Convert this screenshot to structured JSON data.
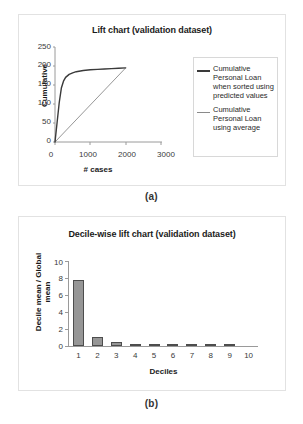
{
  "figure": {
    "caption_a": "(a)",
    "caption_b": "(b)"
  },
  "chart_data": [
    {
      "id": "lift-chart",
      "type": "line",
      "title": "Lift chart (validation dataset)",
      "xlabel": "# cases",
      "ylabel": "Cumulative",
      "xlim": [
        0,
        3000
      ],
      "ylim": [
        0,
        250
      ],
      "xticks": [
        0,
        1000,
        2000,
        3000
      ],
      "yticks": [
        0,
        50,
        100,
        150,
        200,
        250
      ],
      "grid": false,
      "legend_position": "right",
      "series": [
        {
          "name": "Cumulative Personal Loan when sorted using predicted values",
          "color": "#3a3a3a",
          "x": [
            0,
            60,
            120,
            180,
            240,
            300,
            400,
            500,
            600,
            800,
            1000,
            1200,
            1400,
            1600,
            1800,
            2000
          ],
          "y": [
            0,
            52,
            104,
            142,
            160,
            170,
            178,
            182,
            185,
            188,
            190,
            191,
            192,
            193,
            194,
            195
          ]
        },
        {
          "name": "Cumulative Personal Loan using average",
          "color": "#8a8a8a",
          "x": [
            0,
            2000
          ],
          "y": [
            0,
            195
          ]
        }
      ]
    },
    {
      "id": "decile-lift-chart",
      "type": "bar",
      "title": "Decile-wise lift chart (validation dataset)",
      "xlabel": "Deciles",
      "ylabel": "Decile mean / Global\nmean",
      "ylim": [
        0,
        10
      ],
      "yticks": [
        0,
        2,
        4,
        6,
        8,
        10
      ],
      "grid": false,
      "bar_color": "#969696",
      "bar_border_color": "#4d4d4d",
      "categories": [
        "1",
        "2",
        "3",
        "4",
        "5",
        "6",
        "7",
        "8",
        "9",
        "10"
      ],
      "values": [
        7.75,
        1.05,
        0.5,
        0.25,
        0.1,
        0.1,
        0.1,
        0.12,
        0.08,
        0.0
      ]
    }
  ]
}
